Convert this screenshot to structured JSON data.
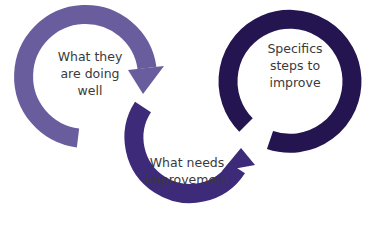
{
  "diagram": {
    "type": "feedback-cycle",
    "steps": [
      {
        "label": "What they\nare doing\nwell",
        "color": "#6a5d9e"
      },
      {
        "label": "What needs\nimprovement",
        "color": "#3d2a78"
      },
      {
        "label": "Specifics\nsteps to\nimprove",
        "color": "#241450"
      }
    ],
    "text_color": "#3a3a3a",
    "background": "#ffffff"
  }
}
